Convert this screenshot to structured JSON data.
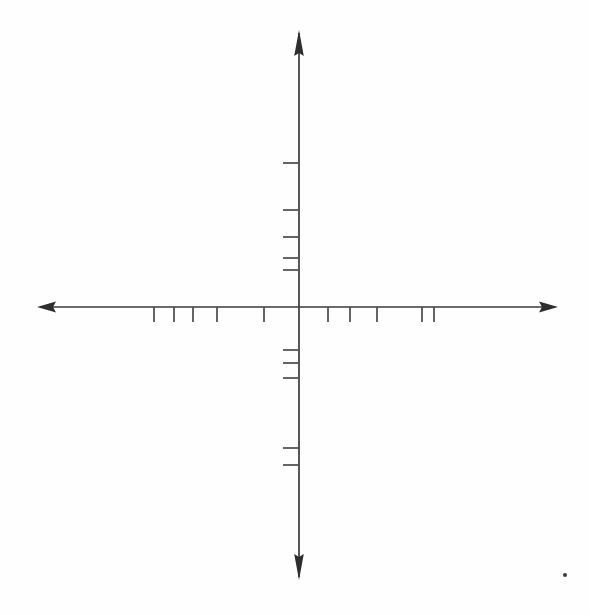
{
  "figure": {
    "title": "",
    "background_color": "#fefefe",
    "axis_color": "#3a3a3a",
    "tick_color": "#4a4a4a",
    "dot_color": "#3b3b3b",
    "origin": {
      "x": 299,
      "y": 307
    }
  },
  "chart_data": {
    "type": "scatter",
    "title": "",
    "subtitle": "",
    "xlabel": "",
    "ylabel": "",
    "grid": false,
    "legend": null,
    "x_axis": {
      "label": "",
      "tick_labels": [],
      "line_start": {
        "x": 37,
        "y": 307
      },
      "line_end": {
        "x": 558,
        "y": 307
      },
      "arrow_left": true,
      "arrow_right": true,
      "ticks_left": [
        {
          "x": 154,
          "length_up": 0,
          "length_down": 15
        },
        {
          "x": 174,
          "length_up": 0,
          "length_down": 15
        },
        {
          "x": 193,
          "length_up": 0,
          "length_down": 15
        },
        {
          "x": 217,
          "length_up": 0,
          "length_down": 15
        },
        {
          "x": 264,
          "length_up": 0,
          "length_down": 15
        }
      ],
      "ticks_right": [
        {
          "x": 328,
          "length_up": 0,
          "length_down": 15
        },
        {
          "x": 350,
          "length_up": 0,
          "length_down": 15
        },
        {
          "x": 377,
          "length_up": 0,
          "length_down": 15
        },
        {
          "x": 422,
          "length_up": 0,
          "length_down": 15
        },
        {
          "x": 434,
          "length_up": 0,
          "length_down": 15
        }
      ]
    },
    "y_axis": {
      "label": "",
      "tick_labels": [],
      "line_start": {
        "x": 299,
        "y": 30
      },
      "line_end": {
        "x": 299,
        "y": 580
      },
      "arrow_up": true,
      "arrow_down": true,
      "ticks_above": [
        {
          "y": 163,
          "length_left": 16,
          "length_right": 0
        },
        {
          "y": 210,
          "length_left": 16,
          "length_right": 0
        },
        {
          "y": 237,
          "length_left": 16,
          "length_right": 0
        },
        {
          "y": 258,
          "length_left": 16,
          "length_right": 0
        },
        {
          "y": 270,
          "length_left": 16,
          "length_right": 0
        }
      ],
      "ticks_below": [
        {
          "y": 350,
          "length_left": 16,
          "length_right": 0
        },
        {
          "y": 363,
          "length_left": 16,
          "length_right": 0
        },
        {
          "y": 378,
          "length_left": 16,
          "length_right": 0
        },
        {
          "y": 448,
          "length_left": 16,
          "length_right": 0
        },
        {
          "y": 465,
          "length_left": 16,
          "length_right": 0
        }
      ]
    },
    "data_points": [],
    "marks": [
      {
        "name": "stray-speck",
        "x": 565,
        "y": 575,
        "r": 2.0
      }
    ]
  }
}
